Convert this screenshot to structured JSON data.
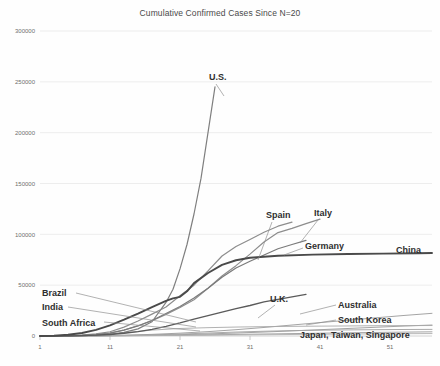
{
  "chart_data": {
    "type": "line",
    "title": "Cumulative Confirmed Cases Since N=20",
    "xlabel": "",
    "ylabel": "",
    "xlim": [
      1,
      57
    ],
    "ylim": [
      0,
      300000
    ],
    "grid": true,
    "legend": "inline-labels",
    "xticks": [
      1,
      11,
      21,
      31,
      41,
      51
    ],
    "yticks": [
      0,
      50000,
      100000,
      150000,
      200000,
      250000,
      300000
    ],
    "ytick_labels": [
      "0",
      "50000",
      "100000",
      "150000",
      "200000",
      "250000",
      "300000"
    ],
    "xtick_labels": [
      "1",
      "11",
      "21",
      "31",
      "41",
      "51"
    ],
    "series": [
      {
        "name": "U.S.",
        "color": "#7f7f7f",
        "width": 1.2,
        "label_x": 209,
        "label_y": 72,
        "leader": [
          [
            216,
            84
          ],
          [
            224,
            96
          ]
        ],
        "x": [
          1,
          3,
          5,
          7,
          9,
          11,
          13,
          15,
          17,
          19,
          20,
          21,
          22,
          23,
          24,
          25,
          26
        ],
        "values": [
          20,
          60,
          160,
          400,
          900,
          1700,
          3500,
          7000,
          14000,
          33000,
          46000,
          66000,
          90000,
          120000,
          155000,
          200000,
          245000
        ]
      },
      {
        "name": "China",
        "color": "#4a4a4a",
        "width": 1.9,
        "label_x": 396,
        "label_y": 245,
        "leader": null,
        "x": [
          1,
          3,
          5,
          7,
          9,
          11,
          13,
          15,
          17,
          19,
          20,
          21,
          22,
          23,
          25,
          27,
          29,
          31,
          35,
          40,
          45,
          50,
          55,
          57
        ],
        "values": [
          20,
          300,
          1200,
          3000,
          6000,
          10500,
          16000,
          22000,
          28500,
          34500,
          37000,
          38500,
          44000,
          52000,
          62000,
          70000,
          74500,
          77000,
          79000,
          80000,
          80600,
          81000,
          81400,
          81600
        ]
      },
      {
        "name": "Italy",
        "color": "#8d8d8d",
        "width": 1.2,
        "label_x": 314,
        "label_y": 208,
        "leader": [
          [
            318,
            220
          ],
          [
            300,
            243
          ]
        ],
        "x": [
          1,
          3,
          5,
          7,
          9,
          11,
          13,
          15,
          17,
          19,
          21,
          23,
          25,
          27,
          29,
          31,
          33,
          35,
          37,
          39,
          41
        ],
        "values": [
          20,
          80,
          230,
          650,
          1700,
          3100,
          5900,
          10100,
          15100,
          21200,
          28000,
          35700,
          47000,
          59000,
          69200,
          80500,
          92500,
          101700,
          105800,
          110500,
          115000
        ]
      },
      {
        "name": "Spain",
        "color": "#8d8d8d",
        "width": 1.2,
        "label_x": 266,
        "label_y": 210,
        "leader": [
          [
            272,
            222
          ],
          [
            258,
            260
          ]
        ],
        "x": [
          1,
          3,
          5,
          7,
          9,
          11,
          13,
          15,
          17,
          19,
          21,
          23,
          25,
          27,
          29,
          31,
          33,
          35,
          37
        ],
        "values": [
          20,
          90,
          280,
          800,
          2100,
          4200,
          8700,
          14700,
          21500,
          28500,
          39600,
          50000,
          64000,
          78700,
          88000,
          95000,
          102000,
          108000,
          112000
        ]
      },
      {
        "name": "Germany",
        "color": "#7a7a7a",
        "width": 1.2,
        "label_x": 305,
        "label_y": 241,
        "leader": [
          [
            303,
            248
          ],
          [
            284,
            255
          ]
        ],
        "x": [
          1,
          3,
          5,
          7,
          9,
          11,
          13,
          15,
          17,
          19,
          21,
          23,
          25,
          27,
          29,
          31,
          33,
          35,
          37,
          39
        ],
        "values": [
          20,
          70,
          200,
          550,
          1200,
          2700,
          5800,
          9900,
          15300,
          22200,
          29000,
          37300,
          47000,
          57700,
          66900,
          73500,
          79700,
          85800,
          90000,
          94000
        ]
      },
      {
        "name": "U.K.",
        "color": "#5a5a5a",
        "width": 1.3,
        "label_x": 270,
        "label_y": 294,
        "leader": [
          [
            275,
            305
          ],
          [
            258,
            318
          ]
        ],
        "x": [
          1,
          3,
          5,
          7,
          9,
          11,
          13,
          15,
          17,
          19,
          21,
          23,
          25,
          27,
          29,
          31,
          33,
          35,
          37,
          39
        ],
        "values": [
          20,
          60,
          160,
          400,
          800,
          1500,
          2700,
          4300,
          6600,
          9500,
          12800,
          16500,
          20000,
          23500,
          27000,
          30000,
          33500,
          36000,
          38500,
          41000
        ]
      },
      {
        "name": "Brazil",
        "color": "#9a9a9a",
        "width": 0.9,
        "label_x": 42,
        "label_y": 288,
        "leader": [
          [
            76,
            293
          ],
          [
            196,
            322
          ]
        ],
        "x": [
          1,
          5,
          9,
          13,
          17,
          21,
          25,
          29,
          33,
          37,
          41,
          45,
          49,
          53,
          57
        ],
        "values": [
          20,
          100,
          320,
          800,
          1600,
          2800,
          4300,
          6200,
          8400,
          10800,
          13200,
          15500,
          17900,
          20200,
          22300
        ]
      },
      {
        "name": "India",
        "color": "#9a9a9a",
        "width": 0.9,
        "label_x": 42,
        "label_y": 302,
        "leader": [
          [
            68,
            307
          ],
          [
            196,
            327
          ]
        ],
        "x": [
          1,
          5,
          9,
          13,
          17,
          21,
          25,
          29,
          33,
          37,
          41,
          45,
          49,
          53,
          57
        ],
        "values": [
          20,
          60,
          180,
          400,
          750,
          1300,
          2000,
          2900,
          3900,
          5000,
          6200,
          7400,
          8600,
          9800,
          10800
        ]
      },
      {
        "name": "South Africa",
        "color": "#9a9a9a",
        "width": 0.9,
        "label_x": 42,
        "label_y": 318,
        "leader": [
          [
            104,
            322
          ],
          [
            200,
            331
          ]
        ],
        "x": [
          1,
          5,
          9,
          13,
          17,
          21,
          25,
          29,
          33,
          37,
          41,
          45,
          49,
          53,
          57
        ],
        "values": [
          20,
          50,
          130,
          280,
          500,
          800,
          1150,
          1550,
          1950,
          2350,
          2750,
          3150,
          3500,
          3800,
          4100
        ]
      },
      {
        "name": "Australia",
        "color": "#a0a0a0",
        "width": 0.9,
        "label_x": 338,
        "label_y": 300,
        "leader": [
          [
            336,
            305
          ],
          [
            300,
            314
          ]
        ],
        "x": [
          1,
          5,
          9,
          13,
          17,
          21,
          25,
          29,
          33,
          37,
          41,
          45,
          49,
          53,
          57
        ],
        "values": [
          20,
          80,
          230,
          560,
          1100,
          1900,
          2900,
          3900,
          4700,
          5300,
          5700,
          6000,
          6200,
          6400,
          6500
        ]
      },
      {
        "name": "South Korea",
        "color": "#a8a8a8",
        "width": 0.9,
        "label_x": 338,
        "label_y": 315,
        "leader": [
          [
            336,
            320
          ],
          [
            306,
            325
          ]
        ],
        "x": [
          1,
          5,
          9,
          13,
          17,
          21,
          25,
          29,
          33,
          37,
          41,
          45,
          49,
          53,
          57
        ],
        "values": [
          20,
          200,
          900,
          3000,
          5800,
          7400,
          8200,
          8800,
          9200,
          9500,
          9700,
          9900,
          10100,
          10200,
          10300
        ]
      },
      {
        "name": "Japan, Taiwan, Singapore",
        "color": "#b0b0b0",
        "width": 0.9,
        "label_x": 300,
        "label_y": 330,
        "leader": null,
        "x": [
          1,
          9,
          17,
          25,
          33,
          41,
          49,
          57
        ],
        "values": [
          20,
          150,
          400,
          800,
          1250,
          1700,
          2100,
          2400
        ]
      }
    ]
  }
}
